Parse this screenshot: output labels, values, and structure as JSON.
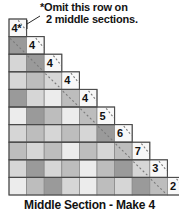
{
  "figure": {
    "type": "quilt-block-piecing-diagram",
    "caption": "Middle Section - Make 4",
    "annotation": {
      "line1": "*Omit this row on",
      "line2": "2 middle sections.",
      "leader_from": [
        40,
        16
      ],
      "leader_to": [
        21,
        27
      ],
      "points_to_cell": "4*"
    },
    "grid": {
      "cell_size": 17.6,
      "origin_x": 9,
      "origin_y": 19,
      "rows": 10,
      "cols": 10,
      "shape": "staircase",
      "description": "Row r spans columns 0..r; each row's rightmost cell is the numbered step cell."
    },
    "colors": {
      "dark": "#9a9a9a",
      "medium": "#bdbdbd",
      "light": "#d6d6d6",
      "pale": "#ececec",
      "white": "#f8f8f8",
      "outline": "#4a4a4a",
      "gridline": "#8a8a8a",
      "dash": "#7a7a7a",
      "text": "#101010"
    },
    "step_labels": [
      "4*",
      "4",
      "4",
      "4",
      "4",
      "5",
      "6",
      "7",
      "3",
      "2"
    ],
    "rows": [
      {
        "index": 0,
        "label": "4*",
        "cells": [
          "white"
        ]
      },
      {
        "index": 1,
        "label": "4",
        "cells": [
          "dark",
          "white"
        ]
      },
      {
        "index": 2,
        "label": "4",
        "cells": [
          "light",
          "dark",
          "white"
        ]
      },
      {
        "index": 3,
        "label": "4",
        "cells": [
          "light",
          "medium",
          "light",
          "white"
        ]
      },
      {
        "index": 4,
        "label": "4",
        "cells": [
          "dark",
          "light",
          "pale",
          "medium",
          "white"
        ]
      },
      {
        "index": 5,
        "label": "5",
        "cells": [
          "pale",
          "dark",
          "medium",
          "pale",
          "medium",
          "white"
        ]
      },
      {
        "index": 6,
        "label": "6",
        "cells": [
          "light",
          "medium",
          "light",
          "medium",
          "light",
          "dark",
          "white"
        ]
      },
      {
        "index": 7,
        "label": "7",
        "cells": [
          "medium",
          "light",
          "medium",
          "pale",
          "medium",
          "light",
          "medium",
          "white"
        ]
      },
      {
        "index": 8,
        "label": "3",
        "cells": [
          "light",
          "dark",
          "light",
          "medium",
          "pale",
          "medium",
          "dark",
          "light",
          "white"
        ]
      },
      {
        "index": 9,
        "label": "2",
        "cells": [
          "pale",
          "medium",
          "dark",
          "light",
          "pale",
          "medium",
          "light",
          "dark",
          "medium",
          "white"
        ]
      }
    ],
    "dashed_seam_line": {
      "style": "dashed-diagonal",
      "description": "Bias seam line running from upper-left down to lower-right along the staircase outer corners"
    }
  }
}
